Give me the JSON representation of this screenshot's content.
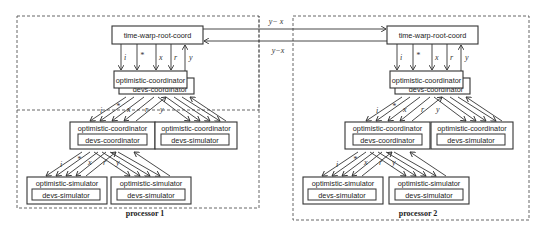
{
  "diagram": {
    "type": "distributed-simulation-hierarchy",
    "links": {
      "top_label": "y− x",
      "bottom_label": "y−x"
    },
    "port_labels": [
      "i",
      "*",
      "x",
      "r",
      "y"
    ],
    "processors": [
      {
        "name": "processor 1",
        "root": "time-warp-root-coord",
        "top_coordinator": {
          "outer": "optimistic-coordinator",
          "inner": "devs-coordinator"
        },
        "mid_left": {
          "outer": "optimistic-coordinator",
          "inner": "devs-coordinator"
        },
        "mid_right": {
          "outer": "optimistic-coordinator",
          "inner": "devs-simulator"
        },
        "leaf_left": {
          "outer": "optimistic-simulator",
          "inner": "devs-simulator"
        },
        "leaf_right": {
          "outer": "optimistic-simulator",
          "inner": "devs-simulator"
        }
      },
      {
        "name": "processor 2",
        "root": "time-warp-root-coord",
        "top_coordinator": {
          "outer": "optimistic-coordinator",
          "inner": "devs-coordinator"
        },
        "mid_left": {
          "outer": "optimistic-coordinator",
          "inner": "devs-coordinator"
        },
        "mid_right": {
          "outer": "optimistic-coordinator",
          "inner": "devs-simulator"
        },
        "leaf_left": {
          "outer": "optimistic-simulator",
          "inner": "devs-simulator"
        },
        "leaf_right": {
          "outer": "optimistic-simulator",
          "inner": "devs-simulator"
        }
      }
    ]
  }
}
